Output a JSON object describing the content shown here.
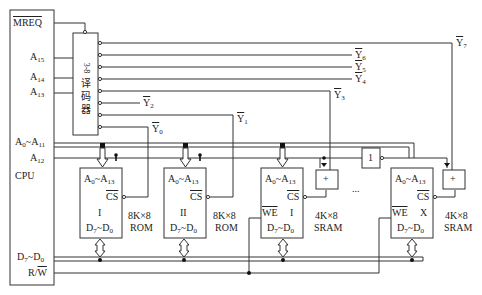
{
  "cpu": {
    "label": "CPU",
    "signals": {
      "mreq": "MREQ",
      "a15": "A15",
      "a14": "A14",
      "a13": "A13",
      "a0_a11": "A0~A11",
      "a12": "A12",
      "d7_d0": "D7~D0",
      "rw": "R/W"
    }
  },
  "decoder": {
    "label_top": "3-8",
    "label_chars": [
      "译",
      "码",
      "器"
    ],
    "outputs": [
      "Y0",
      "Y1",
      "Y2",
      "Y3",
      "Y4",
      "Y5",
      "Y6",
      "Y7"
    ]
  },
  "chips": [
    {
      "id": "rom1",
      "addr": "A0~A13",
      "cs": "CS",
      "index": "I",
      "data": "D7~D0",
      "size": "8K×8",
      "type": "ROM",
      "we": null
    },
    {
      "id": "rom2",
      "addr": "A0~A13",
      "cs": "CS",
      "index": "II",
      "data": "D7~D0",
      "size": "8K×8",
      "type": "ROM",
      "we": null
    },
    {
      "id": "sram1",
      "addr": "A0~A13",
      "cs": "CS",
      "index": "I",
      "data": "D7~D0",
      "size": "4K×8",
      "type": "SRAM",
      "we": "WE"
    },
    {
      "id": "sramx",
      "addr": "A0~A13",
      "cs": "CS",
      "index": "X",
      "data": "D7~D0",
      "size": "4K×8",
      "type": "SRAM",
      "we": "WE"
    }
  ],
  "gates": {
    "or_label": "+",
    "not_label": "1",
    "ellipsis": "..."
  }
}
